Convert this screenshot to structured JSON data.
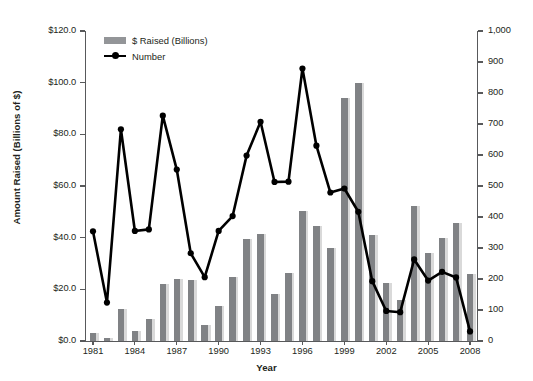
{
  "chart_data": {
    "type": "bar",
    "title": "",
    "xlabel": "Year",
    "ylabel": "Amount Raised (Billions of $)",
    "y2label": "",
    "ylim": [
      0,
      120
    ],
    "y2lim": [
      0,
      1000
    ],
    "grid": false,
    "legend_position": "top-left",
    "categories": [
      1981,
      1982,
      1983,
      1984,
      1985,
      1986,
      1987,
      1988,
      1989,
      1990,
      1991,
      1992,
      1993,
      1994,
      1995,
      1996,
      1997,
      1998,
      1999,
      2000,
      2001,
      2002,
      2003,
      2004,
      2005,
      2006,
      2007,
      2008
    ],
    "x_tick_labels": [
      "1981",
      "1984",
      "1987",
      "1990",
      "1993",
      "1996",
      "1999",
      "2002",
      "2005",
      "2008"
    ],
    "y_tick_labels": [
      "$0.0",
      "$20.0",
      "$40.0",
      "$60.0",
      "$80.0",
      "$100.0",
      "$120.0"
    ],
    "y2_tick_labels": [
      "0",
      "100",
      "200",
      "300",
      "400",
      "500",
      "600",
      "700",
      "800",
      "900",
      "1,000"
    ],
    "series": [
      {
        "name": "$ Raised (Billions)",
        "axis": "left",
        "render": "bar",
        "color": "#808285",
        "shadow_color": "#d9d9d9",
        "values": [
          3.0,
          1.2,
          12.5,
          4.0,
          8.5,
          22.2,
          24.0,
          23.5,
          6.2,
          13.5,
          24.8,
          39.5,
          41.3,
          18.3,
          26.3,
          50.2,
          44.5,
          36.0,
          94.0,
          99.8,
          41.0,
          22.5,
          15.8,
          52.3,
          34.0,
          40.0,
          45.8,
          26.0
        ]
      },
      {
        "name": "Number",
        "axis": "right",
        "render": "line",
        "color": "#000000",
        "values": [
          354,
          124,
          683,
          355,
          360,
          727,
          553,
          283,
          206,
          355,
          403,
          598,
          707,
          513,
          514,
          879,
          630,
          479,
          492,
          417,
          193,
          97,
          93,
          263,
          195,
          223,
          205,
          31
        ]
      }
    ]
  },
  "legend": {
    "items": [
      {
        "label": "$ Raised (Billions)",
        "type": "bar-swatch"
      },
      {
        "label": "Number",
        "type": "line-swatch"
      }
    ]
  },
  "axis_titles": {
    "y": "Amount Raised (Billions of $)",
    "x": "Year"
  }
}
